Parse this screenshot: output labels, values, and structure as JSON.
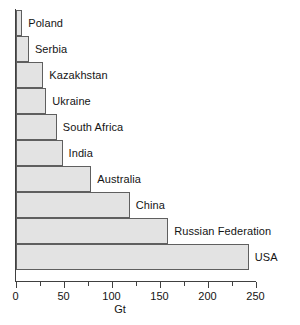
{
  "chart_data": {
    "type": "bar",
    "orientation": "horizontal",
    "title": "",
    "subtitle": "",
    "xlabel": "Gt",
    "ylabel": "",
    "xlim": [
      0,
      250
    ],
    "xticks": [
      0,
      50,
      100,
      150,
      200,
      250
    ],
    "xtick_labels": [
      "0",
      "50",
      "100",
      "150",
      "200",
      "250"
    ],
    "minor_ticks": [
      25,
      75,
      125,
      175,
      225
    ],
    "grid": false,
    "legend": null,
    "categories": [
      "Poland",
      "Serbia",
      "Kazakhstan",
      "Ukraine",
      "South Africa",
      "India",
      "Australia",
      "China",
      "Russian Federation",
      "USA"
    ],
    "values": [
      7,
      14,
      29,
      32,
      43,
      49,
      79,
      119,
      159,
      243
    ],
    "units": "Gt",
    "bar_fill_color": "#e3e3e3",
    "bar_edge_color": "#5f5f5f",
    "axis_color": "#404040",
    "text_color": "#141414",
    "background_color": "#ffffff",
    "bars": [
      {
        "label": "Poland",
        "value": 7
      },
      {
        "label": "Serbia",
        "value": 14
      },
      {
        "label": "Kazakhstan",
        "value": 29
      },
      {
        "label": "Ukraine",
        "value": 32
      },
      {
        "label": "South Africa",
        "value": 43
      },
      {
        "label": "India",
        "value": 49
      },
      {
        "label": "Australia",
        "value": 79
      },
      {
        "label": "China",
        "value": 119
      },
      {
        "label": "Russian Federation",
        "value": 159
      },
      {
        "label": "USA",
        "value": 243
      }
    ]
  }
}
